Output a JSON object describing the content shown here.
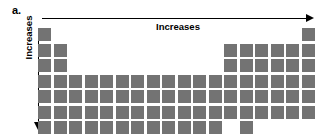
{
  "figure": {
    "panel_label": "a.",
    "background_color": "#ffffff",
    "cell_color": "#737373",
    "axis_color": "#000000"
  },
  "top_axis": {
    "label": "Increases",
    "direction": "left-to-right",
    "arrow_icon": "arrow-right-icon"
  },
  "left_axis": {
    "label": "Increases",
    "direction": "top-to-bottom",
    "arrow_icon": "arrow-down-icon"
  },
  "chart_data": {
    "type": "heatmap",
    "title": "a.",
    "xlabel": "Increases",
    "ylabel": "Increases",
    "grid": false,
    "legend": "none",
    "columns": 18,
    "rows": 7,
    "cell_size_px": 13,
    "cell_pitch_px": 15.5,
    "occupied_columns_by_row": [
      [
        1,
        18
      ],
      [
        1,
        2,
        13,
        14,
        15,
        16,
        17,
        18
      ],
      [
        1,
        2,
        13,
        14,
        15,
        16,
        17,
        18
      ],
      [
        1,
        2,
        3,
        4,
        5,
        6,
        7,
        8,
        9,
        10,
        11,
        12,
        13,
        14,
        15,
        16,
        17,
        18
      ],
      [
        1,
        2,
        3,
        4,
        5,
        6,
        7,
        8,
        9,
        10,
        11,
        12,
        13,
        14,
        15,
        16,
        17,
        18
      ],
      [
        1,
        2,
        3,
        4,
        5,
        6,
        7,
        8,
        9,
        10,
        11,
        12,
        13,
        14,
        15,
        16,
        17,
        18
      ],
      [
        1,
        2,
        3,
        4,
        5,
        6,
        7,
        8,
        9,
        10,
        11,
        12
      ]
    ],
    "extra_cells": [
      {
        "row": 7,
        "column": 14
      }
    ],
    "values": [
      [
        1,
        0,
        0,
        0,
        0,
        0,
        0,
        0,
        0,
        0,
        0,
        0,
        0,
        0,
        0,
        0,
        0,
        1
      ],
      [
        1,
        1,
        0,
        0,
        0,
        0,
        0,
        0,
        0,
        0,
        0,
        0,
        1,
        1,
        1,
        1,
        1,
        1
      ],
      [
        1,
        1,
        0,
        0,
        0,
        0,
        0,
        0,
        0,
        0,
        0,
        0,
        1,
        1,
        1,
        1,
        1,
        1
      ],
      [
        1,
        1,
        1,
        1,
        1,
        1,
        1,
        1,
        1,
        1,
        1,
        1,
        1,
        1,
        1,
        1,
        1,
        1
      ],
      [
        1,
        1,
        1,
        1,
        1,
        1,
        1,
        1,
        1,
        1,
        1,
        1,
        1,
        1,
        1,
        1,
        1,
        1
      ],
      [
        1,
        1,
        1,
        1,
        1,
        1,
        1,
        1,
        1,
        1,
        1,
        1,
        1,
        1,
        1,
        1,
        1,
        1
      ],
      [
        1,
        1,
        1,
        1,
        1,
        1,
        1,
        1,
        1,
        1,
        1,
        1,
        0,
        1,
        0,
        0,
        0,
        0
      ]
    ]
  }
}
